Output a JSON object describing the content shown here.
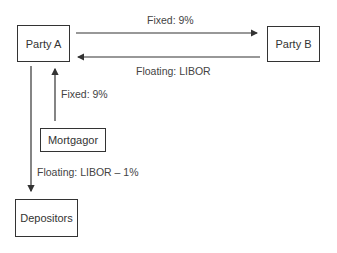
{
  "nodes": {
    "party_a": "Party A",
    "party_b": "Party B",
    "mortgagor": "Mortgagor",
    "depositors": "Depositors"
  },
  "flows": {
    "a_to_b": "Fixed: 9%",
    "b_to_a": "Floating: LIBOR",
    "mortgagor_to_a": "Fixed: 9%",
    "a_to_depositors": "Floating: LIBOR – 1%"
  },
  "colors": {
    "line": "#333333",
    "text": "#444444"
  }
}
